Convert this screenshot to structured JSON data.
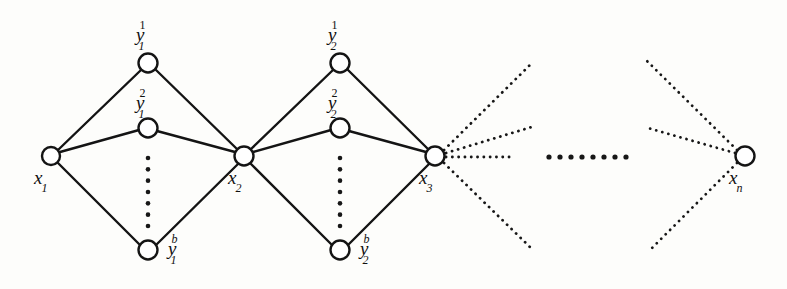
{
  "figure": {
    "kind": "graph-diagram",
    "background_color": "#fdfdfb",
    "ink_color": "#141414",
    "node_fill": "#ffffff",
    "node_radius": 9,
    "width": 787,
    "height": 289
  },
  "nodes": [
    {
      "id": "x1",
      "label_base": "x",
      "label_sub": "1",
      "label_sup": "",
      "cx": 51,
      "cy": 156,
      "r": 9,
      "label_x": 34,
      "label_y": 168,
      "style": "solid"
    },
    {
      "id": "x2",
      "label_base": "x",
      "label_sub": "2",
      "label_sup": "",
      "cx": 244,
      "cy": 156,
      "r": 9.5,
      "label_x": 228,
      "label_y": 168,
      "style": "solid"
    },
    {
      "id": "x3",
      "label_base": "x",
      "label_sub": "3",
      "label_sup": "",
      "cx": 435,
      "cy": 156,
      "r": 9.5,
      "label_x": 419,
      "label_y": 168,
      "style": "solid"
    },
    {
      "id": "xn",
      "label_base": "x",
      "label_sub": "n",
      "label_sup": "",
      "cx": 745,
      "cy": 156,
      "r": 9.5,
      "label_x": 729,
      "label_y": 168,
      "style": "solid"
    },
    {
      "id": "y1_1",
      "label_base": "y",
      "label_sub": "1",
      "label_sup": "1",
      "cx": 148,
      "cy": 63,
      "r": 9.5,
      "label_x": 136,
      "label_y": 24,
      "style": "solid"
    },
    {
      "id": "y1_2",
      "label_base": "y",
      "label_sub": "1",
      "label_sup": "2",
      "cx": 148,
      "cy": 128,
      "r": 9.5,
      "label_x": 136,
      "label_y": 92,
      "style": "solid"
    },
    {
      "id": "y1_b",
      "label_base": "y",
      "label_sub": "1",
      "label_sup": "b",
      "cx": 148,
      "cy": 250,
      "r": 9.5,
      "label_x": 168,
      "label_y": 238,
      "style": "solid"
    },
    {
      "id": "y2_1",
      "label_base": "y",
      "label_sub": "2",
      "label_sup": "1",
      "cx": 340,
      "cy": 63,
      "r": 9.5,
      "label_x": 328,
      "label_y": 24,
      "style": "solid"
    },
    {
      "id": "y2_2",
      "label_base": "y",
      "label_sub": "2",
      "label_sup": "2",
      "cx": 340,
      "cy": 128,
      "r": 9.5,
      "label_x": 328,
      "label_y": 92,
      "style": "solid"
    },
    {
      "id": "y2_b",
      "label_base": "y",
      "label_sub": "2",
      "label_sup": "b",
      "cx": 340,
      "cy": 250,
      "r": 9.5,
      "label_x": 360,
      "label_y": 238,
      "style": "solid"
    }
  ],
  "labels": [
    {
      "id": "lbl-x1",
      "text": "x",
      "sub": "1",
      "sup": "",
      "sup_italic": false,
      "x": 34,
      "y": 168
    },
    {
      "id": "lbl-x2",
      "text": "x",
      "sub": "2",
      "sup": "",
      "sup_italic": false,
      "x": 228,
      "y": 168
    },
    {
      "id": "lbl-x3",
      "text": "x",
      "sub": "3",
      "sup": "",
      "sup_italic": false,
      "x": 419,
      "y": 168
    },
    {
      "id": "lbl-xn",
      "text": "x",
      "sub": "n",
      "sup": "",
      "sup_italic": true,
      "x": 729,
      "y": 168
    },
    {
      "id": "lbl-y1-1",
      "text": "y",
      "sub": "1",
      "sup": "1",
      "sup_italic": false,
      "x": 136,
      "y": 24
    },
    {
      "id": "lbl-y1-2",
      "text": "y",
      "sub": "1",
      "sup": "2",
      "sup_italic": false,
      "x": 136,
      "y": 92
    },
    {
      "id": "lbl-y1-b",
      "text": "y",
      "sub": "1",
      "sup": "b",
      "sup_italic": true,
      "x": 168,
      "y": 238
    },
    {
      "id": "lbl-y2-1",
      "text": "y",
      "sub": "2",
      "sup": "1",
      "sup_italic": false,
      "x": 328,
      "y": 24
    },
    {
      "id": "lbl-y2-2",
      "text": "y",
      "sub": "2",
      "sup": "2",
      "sup_italic": false,
      "x": 328,
      "y": 92
    },
    {
      "id": "lbl-y2-b",
      "text": "y",
      "sub": "2",
      "sup": "b",
      "sup_italic": true,
      "x": 360,
      "y": 238
    }
  ],
  "edges_solid": [
    {
      "id": "e-x1-y1_1",
      "from": "x1",
      "to": "y1_1",
      "x1": 58,
      "y1": 150,
      "x2": 141,
      "y2": 70
    },
    {
      "id": "e-x1-y1_2",
      "from": "x1",
      "to": "y1_2",
      "x1": 60,
      "y1": 152,
      "x2": 139,
      "y2": 130
    },
    {
      "id": "e-x1-y1_b",
      "from": "x1",
      "to": "y1_b",
      "x1": 58,
      "y1": 163,
      "x2": 140,
      "y2": 245
    },
    {
      "id": "e-y1_1-x2",
      "from": "y1_1",
      "to": "x2",
      "x1": 156,
      "y1": 70,
      "x2": 238,
      "y2": 150
    },
    {
      "id": "e-y1_2-x2",
      "from": "y1_2",
      "to": "x2",
      "x1": 157,
      "y1": 131,
      "x2": 235,
      "y2": 152
    },
    {
      "id": "e-y1_b-x2",
      "from": "y1_b",
      "to": "x2",
      "x1": 156,
      "y1": 245,
      "x2": 238,
      "y2": 164
    },
    {
      "id": "e-x2-y2_1",
      "from": "x2",
      "to": "y2_1",
      "x1": 250,
      "y1": 150,
      "x2": 333,
      "y2": 70
    },
    {
      "id": "e-x2-y2_2",
      "from": "x2",
      "to": "y2_2",
      "x1": 253,
      "y1": 152,
      "x2": 331,
      "y2": 130
    },
    {
      "id": "e-x2-y2_b",
      "from": "x2",
      "to": "y2_b",
      "x1": 250,
      "y1": 163,
      "x2": 332,
      "y2": 245
    },
    {
      "id": "e-y2_1-x3",
      "from": "y2_1",
      "to": "x3",
      "x1": 348,
      "y1": 70,
      "x2": 429,
      "y2": 150
    },
    {
      "id": "e-y2_2-x3",
      "from": "y2_2",
      "to": "x3",
      "x1": 349,
      "y1": 131,
      "x2": 426,
      "y2": 152
    },
    {
      "id": "e-y2_b-x3",
      "from": "y2_b",
      "to": "x3",
      "x1": 348,
      "y1": 245,
      "x2": 429,
      "y2": 164
    }
  ],
  "edges_dotted": [
    {
      "id": "d-x3-up-steep",
      "from": "x3",
      "x1": 444,
      "y1": 150,
      "x2": 533,
      "y2": 62
    },
    {
      "id": "d-x3-up-shallow",
      "from": "x3",
      "x1": 446,
      "y1": 153,
      "x2": 535,
      "y2": 126
    },
    {
      "id": "d-x3-right",
      "from": "x3",
      "x1": 446,
      "y1": 157,
      "x2": 512,
      "y2": 157
    },
    {
      "id": "d-x3-down",
      "from": "x3",
      "x1": 444,
      "y1": 163,
      "x2": 533,
      "y2": 250
    },
    {
      "id": "d-xn-up-steep",
      "from": "xn",
      "x1": 737,
      "y1": 150,
      "x2": 647,
      "y2": 61
    },
    {
      "id": "d-xn-left",
      "from": "xn",
      "x1": 735,
      "y1": 153,
      "x2": 648,
      "y2": 128
    },
    {
      "id": "d-xn-down",
      "from": "xn",
      "x1": 737,
      "y1": 163,
      "x2": 650,
      "y2": 250
    }
  ],
  "ellipses_vertical": [
    {
      "id": "vdots-cluster-1",
      "cx": 148,
      "y_start": 158,
      "y_end": 226,
      "count": 7,
      "r": 2.3
    },
    {
      "id": "vdots-cluster-2",
      "cx": 340,
      "y_start": 158,
      "y_end": 226,
      "count": 7,
      "r": 2.3
    }
  ],
  "ellipses_horizontal": [
    {
      "id": "hdots-middle",
      "cy": 157,
      "x_start": 549,
      "x_end": 626,
      "count": 8,
      "r": 2.6
    }
  ]
}
